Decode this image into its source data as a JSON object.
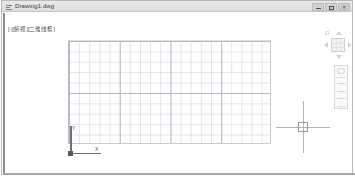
{
  "window": {
    "title": "Drawing1.dwg",
    "app_icon": "document-icon",
    "controls": [
      {
        "name": "minimize",
        "glyph": "—"
      },
      {
        "name": "maximize",
        "glyph": "□"
      },
      {
        "name": "close",
        "glyph": "✕"
      }
    ]
  },
  "viewport": {
    "label": "[-][俯视][二维线框]",
    "ucs": {
      "y_label": "Y",
      "x_label": "X"
    },
    "grid": {
      "visible": "true"
    },
    "cursor": {
      "type": "crosshair-with-pickbox"
    }
  },
  "viewcube": {
    "name": "view-cube",
    "home_label": "",
    "arrows": [
      "north",
      "south",
      "west",
      "east"
    ]
  },
  "navbar": {
    "name": "navigation-bar",
    "items": [
      "steering-wheel",
      "pan",
      "zoom",
      "orbit",
      "showmotion"
    ]
  },
  "colors": {
    "titlebar_bg": "#e4e4e4",
    "grid_minor": "#e2e2ea",
    "grid_major": "#b9b9c6",
    "crosshair": "#b4b4b4",
    "ucs_axis": "#6e6e6e",
    "canvas_bg": "#ffffff"
  }
}
